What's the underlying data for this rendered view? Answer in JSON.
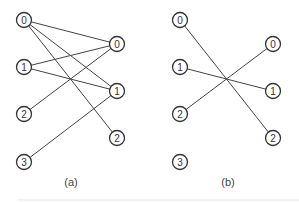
{
  "panels": [
    {
      "caption": "(a)",
      "left_nodes": [
        {
          "label": "0",
          "x": 24,
          "y": 20
        },
        {
          "label": "1",
          "x": 24,
          "y": 67
        },
        {
          "label": "2",
          "x": 24,
          "y": 114
        },
        {
          "label": "3",
          "x": 24,
          "y": 162
        }
      ],
      "right_nodes": [
        {
          "label": "0",
          "x": 117,
          "y": 44
        },
        {
          "label": "1",
          "x": 117,
          "y": 91
        },
        {
          "label": "2",
          "x": 117,
          "y": 138
        }
      ],
      "edges": [
        [
          0,
          0
        ],
        [
          0,
          1
        ],
        [
          0,
          2
        ],
        [
          1,
          0
        ],
        [
          1,
          1
        ],
        [
          2,
          0
        ],
        [
          3,
          1
        ]
      ]
    },
    {
      "caption": "(b)",
      "left_nodes": [
        {
          "label": "0",
          "x": 180,
          "y": 20
        },
        {
          "label": "1",
          "x": 180,
          "y": 67
        },
        {
          "label": "2",
          "x": 180,
          "y": 114
        },
        {
          "label": "3",
          "x": 180,
          "y": 162
        }
      ],
      "right_nodes": [
        {
          "label": "0",
          "x": 273,
          "y": 44
        },
        {
          "label": "1",
          "x": 273,
          "y": 91
        },
        {
          "label": "2",
          "x": 273,
          "y": 138
        }
      ],
      "edges": [
        [
          0,
          2
        ],
        [
          1,
          1
        ],
        [
          2,
          0
        ]
      ]
    }
  ]
}
